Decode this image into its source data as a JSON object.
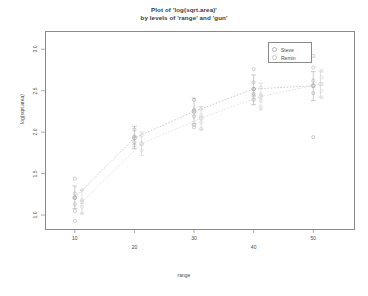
{
  "title": {
    "line1": "Plot of 'log(sqrt.area)'",
    "line2": "by levels of 'range' and 'gun'"
  },
  "axes": {
    "xlabel": "range",
    "ylabel": "log(sqrt.area)",
    "x_ticks": [
      10,
      20,
      30,
      40,
      50
    ],
    "y_ticks": [
      1.0,
      1.5,
      2.0,
      2.5,
      3.0
    ],
    "xlim": [
      5,
      57
    ],
    "ylim": [
      0.82,
      3.22
    ]
  },
  "legend": {
    "items": [
      {
        "label": "Steve",
        "color": "#b0b0b0"
      },
      {
        "label": "Remin",
        "color": "#c8c8c8"
      }
    ]
  },
  "chart_data": {
    "type": "scatter",
    "title": "Plot of 'log(sqrt.area)' by levels of 'range' and 'gun'",
    "xlabel": "range",
    "ylabel": "log(sqrt.area)",
    "xlim": [
      5,
      57
    ],
    "ylim": [
      0.82,
      3.22
    ],
    "x": [
      10,
      20,
      30,
      40,
      50
    ],
    "grid": false,
    "legend_position": "top-right",
    "series": [
      {
        "name": "Steve",
        "color": "#a8a8a8",
        "means": [
          1.21,
          1.93,
          2.25,
          2.52,
          2.56
        ],
        "err_low": [
          1.08,
          1.8,
          2.1,
          2.33,
          2.38
        ],
        "err_high": [
          1.35,
          2.07,
          2.41,
          2.69,
          2.73
        ],
        "points": [
          {
            "x": 10,
            "y": 1.44
          },
          {
            "x": 10,
            "y": 1.26
          },
          {
            "x": 10,
            "y": 1.21
          },
          {
            "x": 10,
            "y": 1.13
          },
          {
            "x": 10,
            "y": 1.05
          },
          {
            "x": 10,
            "y": 0.93
          },
          {
            "x": 20,
            "y": 2.03
          },
          {
            "x": 20,
            "y": 1.95
          },
          {
            "x": 20,
            "y": 1.88
          },
          {
            "x": 20,
            "y": 1.84
          },
          {
            "x": 30,
            "y": 2.39
          },
          {
            "x": 30,
            "y": 2.27
          },
          {
            "x": 30,
            "y": 2.19
          },
          {
            "x": 30,
            "y": 2.09
          },
          {
            "x": 30,
            "y": 2.06
          },
          {
            "x": 40,
            "y": 2.76
          },
          {
            "x": 40,
            "y": 2.6
          },
          {
            "x": 40,
            "y": 2.52
          },
          {
            "x": 40,
            "y": 2.46
          },
          {
            "x": 40,
            "y": 2.44
          },
          {
            "x": 40,
            "y": 2.39
          },
          {
            "x": 50,
            "y": 2.92
          },
          {
            "x": 50,
            "y": 2.78
          },
          {
            "x": 50,
            "y": 2.62
          },
          {
            "x": 50,
            "y": 2.56
          },
          {
            "x": 50,
            "y": 2.47
          },
          {
            "x": 50,
            "y": 1.94
          }
        ]
      },
      {
        "name": "Remin",
        "color": "#cfcfcf",
        "means": [
          1.16,
          1.86,
          2.17,
          2.43,
          2.58
        ],
        "err_low": [
          1.02,
          1.72,
          2.03,
          2.27,
          2.42
        ],
        "err_high": [
          1.3,
          2.0,
          2.31,
          2.59,
          2.74
        ],
        "points": [
          {
            "x": 11.2,
            "y": 1.3
          },
          {
            "x": 11.2,
            "y": 1.18
          },
          {
            "x": 11.2,
            "y": 1.1
          },
          {
            "x": 11.2,
            "y": 1.02
          },
          {
            "x": 21.2,
            "y": 1.96
          },
          {
            "x": 21.2,
            "y": 1.86
          },
          {
            "x": 21.2,
            "y": 1.78
          },
          {
            "x": 31.2,
            "y": 2.28
          },
          {
            "x": 31.2,
            "y": 2.2
          },
          {
            "x": 31.2,
            "y": 2.12
          },
          {
            "x": 31.2,
            "y": 2.04
          },
          {
            "x": 41.2,
            "y": 2.54
          },
          {
            "x": 41.2,
            "y": 2.45
          },
          {
            "x": 41.2,
            "y": 2.38
          },
          {
            "x": 41.2,
            "y": 2.3
          },
          {
            "x": 51.4,
            "y": 2.74
          },
          {
            "x": 51.4,
            "y": 2.66
          },
          {
            "x": 51.4,
            "y": 2.58
          },
          {
            "x": 51.4,
            "y": 2.5
          },
          {
            "x": 51.4,
            "y": 2.42
          }
        ]
      }
    ]
  }
}
